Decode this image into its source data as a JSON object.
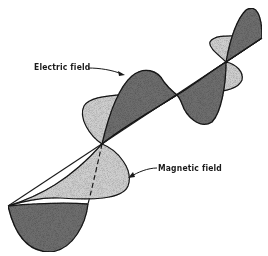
{
  "figure": {
    "labels": {
      "electric": "Electric field",
      "magnetic": "Magnetic field"
    },
    "colors": {
      "background": "#ffffff",
      "outline": "#1a1a1a",
      "electric_fill": "#6e6e6e",
      "magnetic_fill": "#cfcfcf"
    },
    "axis": {
      "start": [
        8,
        206
      ],
      "end": [
        262,
        38
      ]
    },
    "nodes": [
      [
        8,
        206
      ],
      [
        102,
        144
      ],
      [
        177,
        95
      ],
      [
        226,
        62
      ],
      [
        262,
        38
      ]
    ]
  }
}
